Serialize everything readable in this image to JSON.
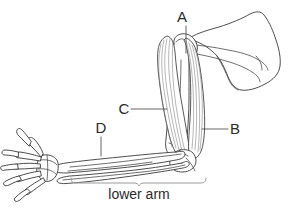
{
  "figure": {
    "background_color": "#ffffff",
    "line_color": "#3a3a3a",
    "label_color": "#2b2b2b",
    "bracket_color": "#9a9a9a",
    "fiber_color": "#7a7a7a"
  },
  "labels": {
    "a": "A",
    "b": "B",
    "c": "C",
    "d": "D",
    "lower_arm": "lower arm"
  },
  "callouts": [
    {
      "id": "a",
      "letter": "A",
      "text_x": 182,
      "text_y": 22,
      "line_from_x": 186,
      "line_from_y": 26,
      "line_to_x": 186,
      "line_to_y": 53,
      "orientation": "vertical"
    },
    {
      "id": "b",
      "letter": "B",
      "text_x": 231,
      "text_y": 134,
      "line_from_x": 228,
      "line_from_y": 129,
      "line_to_x": 202,
      "line_to_y": 129,
      "orientation": "horizontal"
    },
    {
      "id": "c",
      "letter": "C",
      "text_x": 119,
      "text_y": 114,
      "line_from_x": 131,
      "line_from_y": 109,
      "line_to_x": 167,
      "line_to_y": 109,
      "orientation": "horizontal"
    },
    {
      "id": "d",
      "letter": "D",
      "text_x": 96,
      "text_y": 133,
      "line_from_x": 101,
      "line_from_y": 137,
      "line_to_x": 101,
      "line_to_y": 156,
      "orientation": "vertical"
    }
  ],
  "region_bracket": {
    "label": "lower arm",
    "label_x": 139,
    "label_y": 198,
    "left_x": 71,
    "right_x": 206,
    "top_y": 178,
    "bottom_y": 183,
    "tick_x": 139
  }
}
